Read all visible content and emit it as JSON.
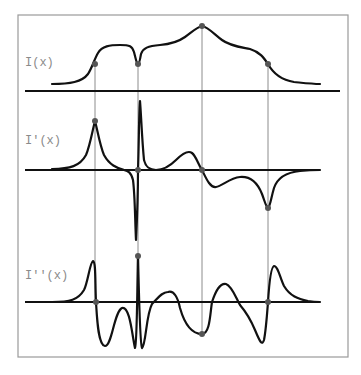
{
  "diagram": {
    "title": "",
    "panels": [
      {
        "id": "intensity",
        "label": "I(x)",
        "axis_y": 91
      },
      {
        "id": "first-derivative",
        "label": "I′(x)",
        "axis_y": 170
      },
      {
        "id": "second-derivative",
        "label": "I′′(x)",
        "axis_y": 302
      }
    ],
    "guide_lines_x": [
      95,
      138,
      202,
      268
    ],
    "colors": {
      "curve": "#111111",
      "axis": "#111111",
      "guide": "#8c8c8c",
      "marker": "#555555",
      "label": "#8a8a8a",
      "frame": "#9a9a9a"
    }
  }
}
